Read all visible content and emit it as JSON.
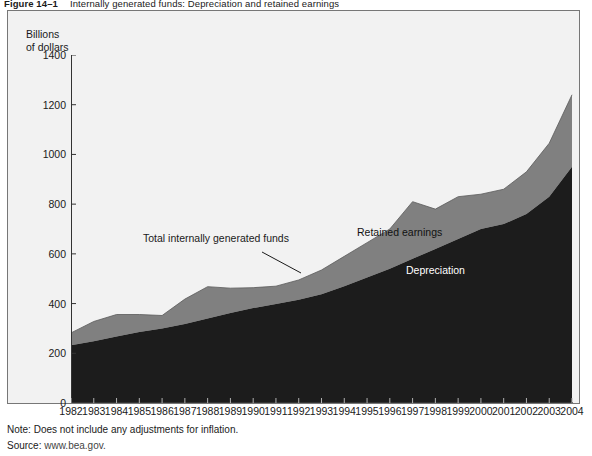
{
  "figure": {
    "number": "Figure 14–1",
    "caption": "Internally generated funds: Depreciation and retained earnings"
  },
  "notes": {
    "note_label": "Note:",
    "note_text": "Does not include any adjustments for inflation.",
    "note_full": "Note: Does not include any adjustments for inflation.",
    "source_label": "Source:",
    "source_text": "www.bea.gov.",
    "source_full": "Source: www.bea.gov."
  },
  "annotations": {
    "total": "Total internally generated funds",
    "retained": "Retained earnings",
    "depreciation": "Depreciation"
  },
  "colors": {
    "depreciation": "#1c1c1c",
    "retained_earnings": "#808080",
    "plot_background": "#f2f2f2",
    "frame_border": "#777777",
    "axis": "#333333"
  },
  "chart_data": {
    "type": "area",
    "stacked": true,
    "title": "Internally generated funds: Depreciation and retained earnings",
    "xlabel": "",
    "ylabel": "Billions\nof dollars",
    "ylabel_line1": "Billions",
    "ylabel_line2": "of dollars",
    "ylim": [
      0,
      1400
    ],
    "yticks": [
      0,
      200,
      400,
      600,
      800,
      1000,
      1200,
      1400
    ],
    "ytick_labels": [
      "0",
      "200",
      "400",
      "600",
      "800",
      "1000",
      "1200",
      "1400"
    ],
    "grid": false,
    "legend": "in-plot annotations",
    "categories": [
      "1982",
      "1983",
      "1984",
      "1985",
      "1986",
      "1987",
      "1988",
      "1989",
      "1990",
      "1991",
      "1992",
      "1993",
      "1994",
      "1995",
      "1996",
      "1997",
      "1998",
      "1999",
      "2000",
      "2001",
      "2002",
      "2003",
      "2004"
    ],
    "series": [
      {
        "name": "Depreciation",
        "color": "#1c1c1c",
        "values": [
          232,
          248,
          268,
          286,
          300,
          318,
          340,
          362,
          382,
          398,
          415,
          438,
          470,
          505,
          540,
          580,
          620,
          660,
          700,
          720,
          760,
          830,
          950
        ]
      },
      {
        "name": "Retained earnings",
        "color": "#808080",
        "values": [
          50,
          80,
          88,
          70,
          52,
          100,
          128,
          100,
          82,
          72,
          80,
          97,
          120,
          140,
          160,
          230,
          160,
          170,
          140,
          140,
          170,
          215,
          290
        ]
      }
    ],
    "totals": {
      "name": "Total internally generated funds",
      "values": [
        282,
        328,
        356,
        356,
        352,
        418,
        468,
        462,
        464,
        470,
        495,
        535,
        590,
        645,
        700,
        810,
        780,
        830,
        840,
        860,
        930,
        1045,
        1240
      ]
    }
  }
}
